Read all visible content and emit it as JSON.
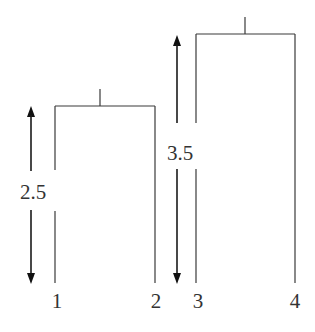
{
  "diagram": {
    "type": "dendrogram",
    "leaves": [
      {
        "label": "1"
      },
      {
        "label": "2"
      },
      {
        "label": "3"
      },
      {
        "label": "4"
      }
    ],
    "clusters": [
      {
        "members": [
          "1",
          "2"
        ],
        "height_label": "2.5"
      },
      {
        "members": [
          "3",
          "4"
        ],
        "height_label": "3.5"
      }
    ]
  }
}
